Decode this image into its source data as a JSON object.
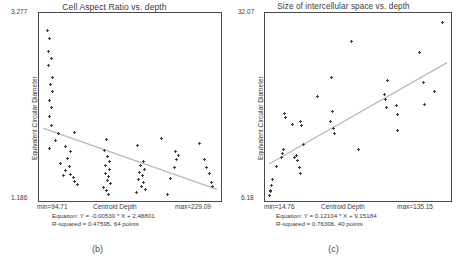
{
  "figure": {
    "panels": [
      {
        "caption": "(b)",
        "title": "Cell Aspect Ratio vs. depth",
        "ylabel": "Equivalent Circular Diameter",
        "xlabel": "Centroid Depth",
        "ytick_max": "3.277",
        "ytick_min": "1.186",
        "xtick_min": "min=94.71",
        "xtick_max": "max=229.09",
        "equation": "Equation: Y = -0.00530 * X + 2.48801",
        "rsquared": "R-squared = 0.47595, 64 points"
      },
      {
        "caption": "(c)",
        "title": "Size of intercellular space vs. depth",
        "ylabel": "Equivalent Circular Diameter",
        "xlabel": "Centroid Depth",
        "ytick_max": "32.07",
        "ytick_min": "6.18",
        "xtick_min": "min=14.76",
        "xtick_max": "max=135.15",
        "equation": "Equation: Y = 0.12104 * X + 9.15184",
        "rsquared": "R-squared = 0.76306, 40 points"
      }
    ]
  },
  "chart_data": [
    {
      "type": "scatter",
      "title": "Cell Aspect Ratio vs. depth",
      "xlabel": "Centroid Depth",
      "ylabel": "Equivalent Circular Diameter",
      "xlim": [
        94.71,
        229.09
      ],
      "ylim": [
        1.186,
        3.277
      ],
      "grid": false,
      "legend": "none",
      "regression": {
        "slope": -0.0053,
        "intercept": 2.48801,
        "r_squared": 0.47595,
        "equation_text": "Equation: Y = -0.00530 * X + 2.48801",
        "rsquared_text": "R-squared = 0.47595, 64 points",
        "color": "#b9b9b9"
      },
      "n_points": 64,
      "points": [
        [
          98.1,
          3.12
        ],
        [
          99.4,
          3.03
        ],
        [
          98.9,
          2.88
        ],
        [
          101.6,
          2.79
        ],
        [
          99.2,
          2.71
        ],
        [
          102.0,
          2.58
        ],
        [
          100.3,
          2.49
        ],
        [
          102.4,
          2.41
        ],
        [
          99.8,
          2.31
        ],
        [
          100.9,
          2.22
        ],
        [
          99.5,
          2.12
        ],
        [
          101.2,
          2.02
        ],
        [
          106.5,
          1.92
        ],
        [
          119.4,
          1.93
        ],
        [
          104.6,
          1.84
        ],
        [
          99.8,
          1.75
        ],
        [
          112.0,
          1.77
        ],
        [
          116.0,
          1.72
        ],
        [
          113.5,
          1.63
        ],
        [
          108.5,
          1.58
        ],
        [
          114.8,
          1.54
        ],
        [
          112.4,
          1.49
        ],
        [
          116.3,
          1.45
        ],
        [
          118.5,
          1.41
        ],
        [
          110.2,
          1.43
        ],
        [
          119.1,
          1.37
        ],
        [
          121.0,
          1.33
        ],
        [
          143.6,
          1.85
        ],
        [
          142.0,
          1.73
        ],
        [
          144.5,
          1.66
        ],
        [
          145.7,
          1.6
        ],
        [
          143.2,
          1.55
        ],
        [
          146.4,
          1.5
        ],
        [
          142.8,
          1.46
        ],
        [
          145.0,
          1.42
        ],
        [
          144.2,
          1.38
        ],
        [
          146.9,
          1.34
        ],
        [
          141.5,
          1.3
        ],
        [
          143.9,
          1.26
        ],
        [
          145.3,
          1.22
        ],
        [
          167.8,
          1.78
        ],
        [
          172.5,
          1.6
        ],
        [
          170.1,
          1.55
        ],
        [
          173.0,
          1.51
        ],
        [
          169.3,
          1.47
        ],
        [
          171.8,
          1.43
        ],
        [
          168.6,
          1.39
        ],
        [
          172.2,
          1.35
        ],
        [
          170.6,
          1.31
        ],
        [
          174.0,
          1.27
        ],
        [
          167.2,
          1.24
        ],
        [
          186.3,
          1.86
        ],
        [
          197.2,
          1.72
        ],
        [
          199.0,
          1.67
        ],
        [
          198.1,
          1.62
        ],
        [
          196.5,
          1.53
        ],
        [
          193.4,
          1.4
        ],
        [
          191.0,
          1.21
        ],
        [
          215.9,
          1.81
        ],
        [
          219.4,
          1.62
        ],
        [
          221.0,
          1.53
        ],
        [
          223.6,
          1.46
        ],
        [
          224.8,
          1.36
        ],
        [
          226.0,
          1.31
        ]
      ]
    },
    {
      "type": "scatter",
      "title": "Size of intercellular space vs. depth",
      "xlabel": "Centroid Depth",
      "ylabel": "Equivalent Circular Diameter",
      "xlim": [
        14.76,
        135.15
      ],
      "ylim": [
        6.18,
        32.07
      ],
      "grid": false,
      "legend": "none",
      "regression": {
        "slope": 0.12104,
        "intercept": 9.15184,
        "r_squared": 0.76306,
        "equation_text": "Equation: Y = 0.12104 * X + 9.15184",
        "rsquared_text": "R-squared = 0.76306, 40 points",
        "color": "#b9b9b9"
      },
      "n_points": 40,
      "points": [
        [
          15.2,
          6.4
        ],
        [
          15.9,
          7.1
        ],
        [
          16.4,
          7.9
        ],
        [
          17.1,
          8.7
        ],
        [
          15.5,
          6.9
        ],
        [
          19.8,
          10.6
        ],
        [
          23.1,
          11.9
        ],
        [
          24.0,
          12.5
        ],
        [
          24.6,
          13.0
        ],
        [
          25.4,
          18.2
        ],
        [
          26.1,
          17.6
        ],
        [
          30.5,
          16.6
        ],
        [
          32.0,
          11.8
        ],
        [
          33.2,
          12.1
        ],
        [
          34.0,
          11.5
        ],
        [
          35.1,
          10.4
        ],
        [
          35.8,
          9.6
        ],
        [
          36.4,
          17.0
        ],
        [
          37.0,
          16.4
        ],
        [
          38.2,
          13.8
        ],
        [
          47.5,
          20.6
        ],
        [
          56.5,
          17.0
        ],
        [
          57.1,
          23.4
        ],
        [
          57.8,
          18.5
        ],
        [
          58.4,
          16.1
        ],
        [
          59.0,
          15.3
        ],
        [
          70.8,
          28.6
        ],
        [
          75.6,
          13.0
        ],
        [
          93.2,
          20.9
        ],
        [
          93.8,
          20.2
        ],
        [
          94.4,
          19.1
        ],
        [
          95.0,
          22.9
        ],
        [
          100.8,
          19.4
        ],
        [
          101.4,
          18.0
        ],
        [
          101.9,
          15.7
        ],
        [
          116.6,
          26.9
        ],
        [
          119.0,
          22.7
        ],
        [
          120.2,
          19.5
        ],
        [
          126.9,
          21.4
        ],
        [
          132.2,
          31.3
        ]
      ]
    }
  ]
}
